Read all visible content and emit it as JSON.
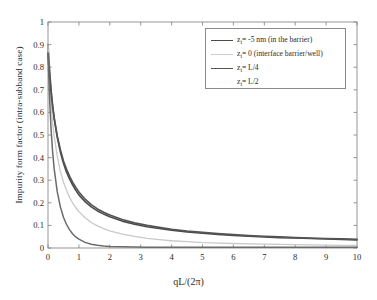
{
  "chart_data": {
    "type": "line",
    "title": "",
    "xlabel": "qL/(2π)",
    "ylabel": "Impurity form factor (intra-subband case)",
    "xlim": [
      0,
      10
    ],
    "ylim": [
      0,
      1
    ],
    "grid": false,
    "legend_position": "upper-right",
    "xticks": [
      "0",
      "1",
      "2",
      "3",
      "4",
      "5",
      "6",
      "7",
      "8",
      "9",
      "10"
    ],
    "yticks": [
      "0",
      "0.1",
      "0.2",
      "0.3",
      "0.4",
      "0.5",
      "0.6",
      "0.7",
      "0.8",
      "0.9",
      "1"
    ],
    "x": [
      0,
      0.05,
      0.1,
      0.15,
      0.2,
      0.3,
      0.4,
      0.5,
      0.6,
      0.7,
      0.8,
      0.9,
      1.0,
      1.2,
      1.4,
      1.6,
      1.8,
      2.0,
      2.4,
      2.8,
      3.2,
      3.6,
      4.0,
      4.5,
      5.0,
      5.5,
      6.0,
      6.5,
      7.0,
      7.5,
      8.0,
      8.5,
      9.0,
      9.5,
      10.0
    ],
    "series": [
      {
        "name": "z_i = -5 nm (in the barrier)",
        "label": "zᵢ= -5 nm (in the barrier)",
        "color": "#4a4a4a",
        "width": 1.6,
        "values": [
          0.9,
          0.79,
          0.7,
          0.63,
          0.575,
          0.49,
          0.425,
          0.375,
          0.335,
          0.305,
          0.278,
          0.255,
          0.235,
          0.205,
          0.182,
          0.164,
          0.15,
          0.138,
          0.119,
          0.105,
          0.094,
          0.086,
          0.079,
          0.071,
          0.065,
          0.06,
          0.056,
          0.052,
          0.049,
          0.046,
          0.044,
          0.042,
          0.04,
          0.038,
          0.036
        ]
      },
      {
        "name": "z_i = 0 (interface barrier/well)",
        "label": "zᵢ= 0 (interface barrier/well)",
        "color": "#c9c9c9",
        "width": 1.3,
        "values": [
          0.9,
          0.74,
          0.635,
          0.555,
          0.495,
          0.405,
          0.34,
          0.292,
          0.254,
          0.224,
          0.199,
          0.178,
          0.161,
          0.134,
          0.113,
          0.098,
          0.086,
          0.076,
          0.061,
          0.051,
          0.043,
          0.037,
          0.032,
          0.028,
          0.024,
          0.022,
          0.02,
          0.018,
          0.017,
          0.016,
          0.015,
          0.014,
          0.013,
          0.012,
          0.011
        ]
      },
      {
        "name": "z_i = L/4",
        "label": "zᵢ= L/4",
        "color": "#555555",
        "width": 1.7,
        "values": [
          0.862,
          0.76,
          0.685,
          0.625,
          0.575,
          0.495,
          0.435,
          0.385,
          0.348,
          0.317,
          0.29,
          0.268,
          0.248,
          0.216,
          0.192,
          0.173,
          0.158,
          0.146,
          0.126,
          0.111,
          0.1,
          0.091,
          0.083,
          0.075,
          0.069,
          0.064,
          0.059,
          0.055,
          0.052,
          0.049,
          0.046,
          0.044,
          0.042,
          0.04,
          0.038
        ]
      },
      {
        "name": "z_i = L/2",
        "label": "zᵢ= L/2",
        "color": "#6b6b6b",
        "width": 1.5,
        "values": [
          0.862,
          0.665,
          0.525,
          0.425,
          0.35,
          0.248,
          0.182,
          0.136,
          0.104,
          0.08,
          0.062,
          0.049,
          0.039,
          0.025,
          0.017,
          0.012,
          0.009,
          0.007,
          0.005,
          0.004,
          0.003,
          0.003,
          0.003,
          0.003,
          0.003,
          0.003,
          0.003,
          0.003,
          0.003,
          0.003,
          0.003,
          0.003,
          0.003,
          0.003,
          0.003
        ]
      }
    ],
    "legend_entries": [
      {
        "label": "zᵢ= -5 nm (in the barrier)",
        "color": "#4a4a4a",
        "width": 1.8
      },
      {
        "label": "zᵢ= 0 (interface barrier/well)",
        "color": "#cccccc",
        "width": 1.1
      },
      {
        "label": "zᵢ= L/4",
        "color": "#555555",
        "width": 1.9
      },
      {
        "label": "zᵢ= L/2",
        "color": "#fbfbfb",
        "width": 1.1
      }
    ],
    "axis_color": "#8a8a8a",
    "text_color": "#2b2b2b",
    "background": "#ffffff"
  }
}
